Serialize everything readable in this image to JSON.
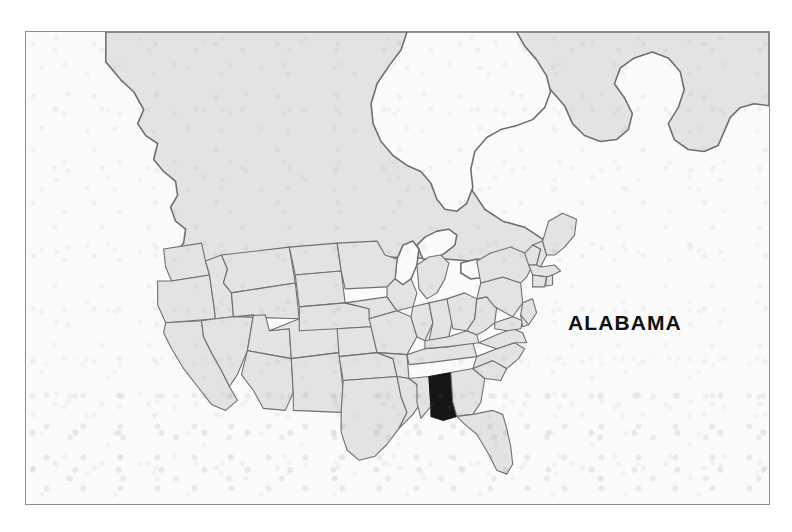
{
  "page": {
    "background_color": "#ffffff",
    "width": 792,
    "height": 532
  },
  "plate": {
    "frame_color": "#8d8d8d",
    "paper_color": "#fbfbfb"
  },
  "map": {
    "title": "ALABAMA",
    "subject": "United States locator map",
    "highlighted_state": "Alabama",
    "highlight_color": "#151515",
    "land_color": "#e3e3e3",
    "water_color": "#fbfbfb",
    "border_color": "#6f6f6f",
    "label": "ALABAMA"
  },
  "margin_marks": {
    "line_1": "A",
    "line_2": "S",
    "line_3": "T",
    "line_4": "I",
    "line_5": "A",
    "line_6": "L",
    "line_7": "W",
    "line_8": "S"
  }
}
